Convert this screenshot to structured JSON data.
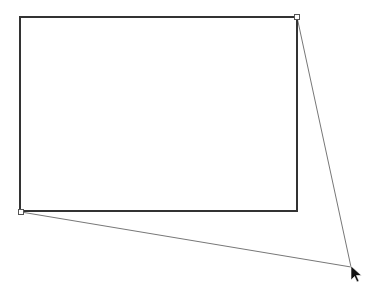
{
  "canvas": {
    "width": 374,
    "height": 298,
    "background": "#ffffff"
  },
  "rectangle": {
    "x": 20,
    "y": 17,
    "width": 277,
    "height": 194,
    "stroke": "#333333",
    "stroke_width": 2,
    "fill": "none"
  },
  "handles": [
    {
      "name": "top-right-handle",
      "x": 297,
      "y": 17
    },
    {
      "name": "bottom-left-handle",
      "x": 21,
      "y": 212
    }
  ],
  "guide_lines": [
    {
      "name": "guide-line-top-right",
      "x1": 297,
      "y1": 17,
      "x2": 351,
      "y2": 267
    },
    {
      "name": "guide-line-bottom-left",
      "x1": 21,
      "y1": 212,
      "x2": 351,
      "y2": 267
    }
  ],
  "guide_color": "#777777",
  "cursor": {
    "icon": "arrow-cursor-icon",
    "x": 351,
    "y": 266,
    "color": "#111111"
  }
}
